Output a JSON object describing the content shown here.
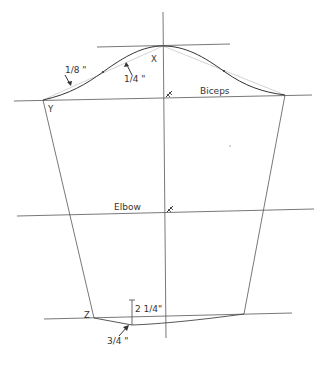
{
  "diagram": {
    "type": "sleeve-pattern-draft",
    "labels": {
      "point_x": "X",
      "point_y": "Y",
      "point_z": "Z",
      "biceps": "Biceps",
      "elbow": "Elbow",
      "measure_1_8": "1/8 \"",
      "measure_1_4": "1/4 \"",
      "measure_2_1_4": "2 1/4\"",
      "measure_3_4": "3/4 \""
    },
    "colors": {
      "line": "#555555",
      "curve": "#333333",
      "guide_curve": "#bbbbbb",
      "text": "#333333"
    }
  }
}
